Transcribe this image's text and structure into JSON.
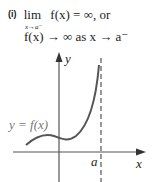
{
  "heading": {
    "number": "(i)",
    "lim": "lim",
    "limit_sub": "x→a⁻",
    "limit_expr": "f(x) = ∞, or",
    "line2": "f(x) → ∞ as x → a⁻"
  },
  "graph": {
    "y_axis_label": "y",
    "x_axis_label": "x",
    "curve_label": "y = f(x)",
    "asymptote_label": "a",
    "axis_color": "#555555",
    "curve_color": "#555555",
    "label_color": "#777777"
  }
}
